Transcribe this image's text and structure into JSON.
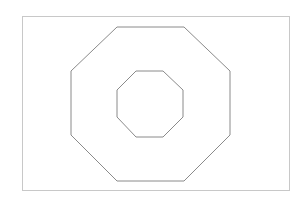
{
  "diagram": {
    "shapes": [
      {
        "name": "frame",
        "type": "rectangle"
      },
      {
        "name": "outer-octagon",
        "type": "octagon"
      },
      {
        "name": "inner-octagon",
        "type": "octagon"
      }
    ],
    "colors": {
      "frame_stroke": "#c8c8c8",
      "octagon_stroke": "#8a8a8a",
      "background": "#ffffff"
    }
  }
}
